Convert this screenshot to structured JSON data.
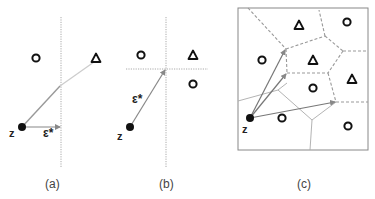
{
  "panels": [
    {
      "id": "a",
      "caption": "(a)",
      "query_label": "z",
      "vector_label": "ε*",
      "description": "Single vertical decision boundary; perturbation ε* is the shortest horizontal move from z to the boundary",
      "points": [
        {
          "shape": "circle",
          "x": 36,
          "y": 58
        },
        {
          "shape": "triangle",
          "x": 96,
          "y": 58
        }
      ]
    },
    {
      "id": "b",
      "caption": "(b)",
      "query_label": "z",
      "vector_label": "ε*",
      "description": "Two axis-aligned boundaries; ε* points from z to their intersection",
      "points": [
        {
          "shape": "circle",
          "x": 141,
          "y": 55
        },
        {
          "shape": "triangle",
          "x": 193,
          "y": 55
        },
        {
          "shape": "circle",
          "x": 193,
          "y": 84
        }
      ]
    },
    {
      "id": "c",
      "caption": "(c)",
      "query_label": "z",
      "description": "Voronoi partition; dashed edges separate circle and triangle cells; several candidate vectors from z to boundary vertices",
      "points": [
        {
          "shape": "triangle",
          "x": 299,
          "y": 25
        },
        {
          "shape": "circle",
          "x": 347,
          "y": 22
        },
        {
          "shape": "circle",
          "x": 262,
          "y": 60
        },
        {
          "shape": "triangle",
          "x": 313,
          "y": 60
        },
        {
          "shape": "triangle",
          "x": 352,
          "y": 79
        },
        {
          "shape": "circle",
          "x": 313,
          "y": 88
        },
        {
          "shape": "circle",
          "x": 282,
          "y": 118
        },
        {
          "shape": "circle",
          "x": 348,
          "y": 126
        }
      ]
    }
  ],
  "colors": {
    "point_stroke": "#111111",
    "vector": "#777777",
    "boundary": "#999999",
    "frame": "#888888"
  }
}
